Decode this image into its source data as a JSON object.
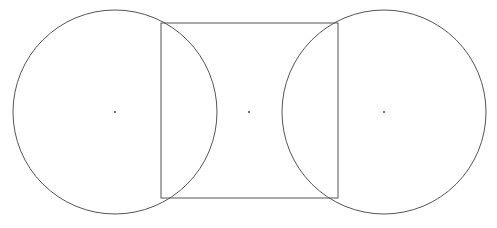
{
  "canvas": {
    "width": 497,
    "height": 228,
    "background": "#ffffff"
  },
  "stroke_color": "#555555",
  "shapes": {
    "left_circle": {
      "cx": 115,
      "cy": 112,
      "r": 102
    },
    "square": {
      "x": 161,
      "y": 23,
      "width": 177,
      "height": 175
    },
    "right_circle": {
      "cx": 384,
      "cy": 112,
      "r": 102
    }
  },
  "center_marks": [
    {
      "x": 115,
      "y": 112
    },
    {
      "x": 249,
      "y": 112
    },
    {
      "x": 384,
      "y": 112
    }
  ]
}
